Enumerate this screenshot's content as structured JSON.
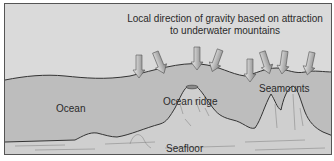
{
  "figure": {
    "title_line1": "Local direction of gravity based on attraction",
    "title_line2": "to underwater mountains",
    "labels": {
      "ocean": "Ocean",
      "ocean_ridge": "Ocean ridge",
      "seamounts": "Seamounts",
      "seafloor": "Seafloor"
    },
    "colors": {
      "sky": "#d9d9d9",
      "ocean": "#bdbdbd",
      "seafloor": "#cfcfcf",
      "arrow": "#aaaaaa",
      "outline": "#333333"
    },
    "arrow_count": 8
  }
}
